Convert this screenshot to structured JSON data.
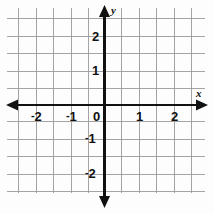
{
  "figure": {
    "kind": "coordinate-plane",
    "background_color": "#fdfdfd",
    "grid_color": "#9a9a9a",
    "axis_color": "#111111"
  },
  "axes": {
    "x": {
      "name": "x",
      "tick_labels": [
        "-2",
        "-1",
        "0",
        "1",
        "2"
      ],
      "tick_values": [
        -2,
        -1,
        0,
        1,
        2
      ],
      "range": [
        -2.75,
        2.75
      ],
      "arrow_both_ends": true
    },
    "y": {
      "name": "y",
      "tick_labels": [
        "2",
        "1",
        "0",
        "-1",
        "-2"
      ],
      "tick_values": [
        2,
        1,
        0,
        -1,
        -2
      ],
      "range": [
        -2.75,
        2.9
      ],
      "arrow_both_ends": true
    }
  },
  "grid": {
    "visible": true,
    "minor_step": 0.5,
    "vertical_line_count": 11,
    "horizontal_line_count": 11
  },
  "labels": {
    "x_neg_2": "2",
    "x_neg_1": "1",
    "x_zero": "0",
    "x_pos_1": "1",
    "x_pos_2": "2",
    "y_pos_2": "2",
    "y_pos_1": "1",
    "y_neg_1": "1",
    "y_neg_2": "2",
    "minus_sign": "-",
    "x_axis_name": "x",
    "y_axis_name": "y"
  }
}
